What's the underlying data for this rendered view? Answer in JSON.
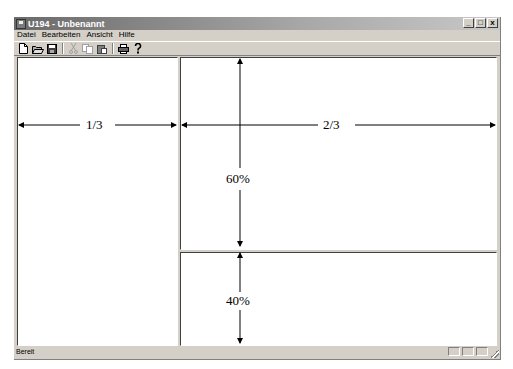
{
  "window": {
    "title": "U194 - Unbenannt",
    "controls": {
      "minimize": "_",
      "maximize": "□",
      "close": "x"
    }
  },
  "menu": {
    "items": [
      {
        "label": "Datei",
        "mnemonic": "D"
      },
      {
        "label": "Bearbeiten",
        "mnemonic": "B"
      },
      {
        "label": "Ansicht",
        "mnemonic": "A"
      },
      {
        "label": "Hilfe",
        "mnemonic": "H"
      }
    ]
  },
  "toolbar": {
    "buttons": [
      {
        "name": "new-file-icon",
        "glyph": "🗋",
        "enabled": true
      },
      {
        "name": "open-folder-icon",
        "glyph": "📂",
        "enabled": true
      },
      {
        "name": "save-icon",
        "glyph": "💾",
        "enabled": true
      },
      {
        "name": "cut-icon",
        "glyph": "✂",
        "enabled": false
      },
      {
        "name": "copy-icon",
        "glyph": "⎘",
        "enabled": false
      },
      {
        "name": "paste-icon",
        "glyph": "📋",
        "enabled": true
      },
      {
        "name": "print-icon",
        "glyph": "🖶",
        "enabled": true
      },
      {
        "name": "help-icon",
        "glyph": "?",
        "enabled": true
      }
    ]
  },
  "annotations": {
    "left_width": "1/3",
    "right_width": "2/3",
    "top_height": "60%",
    "bottom_height": "40%"
  },
  "statusbar": {
    "text": "Bereit"
  }
}
